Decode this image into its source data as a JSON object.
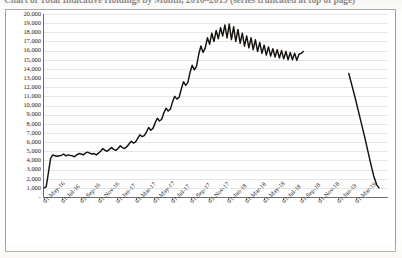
{
  "chart_data": {
    "type": "line",
    "title": "Chart of Total Indicative Holdings by Month, 2016–2019 (series truncated at top of page)",
    "xlabel": "",
    "ylabel": "",
    "grid": true,
    "legend": "none",
    "ylim": [
      0,
      20000
    ],
    "y_ticks": [
      "20,000",
      "19,000",
      "18,000",
      "17,000",
      "16,000",
      "15,000",
      "14,000",
      "13,000",
      "12,000",
      "11,000",
      "10,000",
      "9,000",
      "8,000",
      "7,000",
      "6,000",
      "5,000",
      "4,000",
      "3,000",
      "2,000",
      "1,000",
      "-"
    ],
    "x_ticks": [
      "01-May-16",
      "01-Jul-16",
      "01-Sep-16",
      "01-Nov-16",
      "01-Jan-17",
      "01-Mar-17",
      "01-May-17",
      "01-Jul-17",
      "01-Sep-17",
      "01-Nov-17",
      "01-Jan-18",
      "01-Mar-18",
      "01-May-18",
      "01-Jul-18",
      "01-Sep-18",
      "01-Nov-18",
      "01-Jan-19",
      "01-Mar-19"
    ],
    "x_start": "01-May-16",
    "x_end": "01-Apr-19",
    "series": [
      {
        "name": "main-series",
        "color": "#15120f",
        "note": "continuous trace from May-2016 to approximately Aug-2018",
        "x": [
          "2016-05-01",
          "2016-05-08",
          "2016-05-15",
          "2016-05-22",
          "2016-05-29",
          "2016-06-05",
          "2016-06-12",
          "2016-06-19",
          "2016-06-26",
          "2016-07-03",
          "2016-07-10",
          "2016-07-17",
          "2016-07-24",
          "2016-07-31",
          "2016-08-07",
          "2016-08-14",
          "2016-08-21",
          "2016-08-28",
          "2016-09-04",
          "2016-09-11",
          "2016-09-18",
          "2016-09-25",
          "2016-10-02",
          "2016-10-09",
          "2016-10-16",
          "2016-10-23",
          "2016-10-30",
          "2016-11-06",
          "2016-11-13",
          "2016-11-20",
          "2016-11-27",
          "2016-12-04",
          "2016-12-11",
          "2016-12-18",
          "2016-12-25",
          "2017-01-01",
          "2017-01-08",
          "2017-01-15",
          "2017-01-22",
          "2017-01-29",
          "2017-02-05",
          "2017-02-12",
          "2017-02-19",
          "2017-02-26",
          "2017-03-05",
          "2017-03-12",
          "2017-03-19",
          "2017-03-26",
          "2017-04-02",
          "2017-04-09",
          "2017-04-16",
          "2017-04-23",
          "2017-04-30",
          "2017-05-07",
          "2017-05-14",
          "2017-05-21",
          "2017-05-28",
          "2017-06-04",
          "2017-06-11",
          "2017-06-18",
          "2017-06-25",
          "2017-07-02",
          "2017-07-09",
          "2017-07-16",
          "2017-07-23",
          "2017-07-30",
          "2017-08-06",
          "2017-08-13",
          "2017-08-20",
          "2017-08-27",
          "2017-09-03",
          "2017-09-10",
          "2017-09-17",
          "2017-09-24",
          "2017-10-01",
          "2017-10-08",
          "2017-10-15",
          "2017-10-22",
          "2017-10-29",
          "2017-11-05",
          "2017-11-12",
          "2017-11-19",
          "2017-11-26",
          "2017-12-03",
          "2017-12-10",
          "2017-12-17",
          "2017-12-24",
          "2017-12-31",
          "2018-01-07",
          "2018-01-14",
          "2018-01-21",
          "2018-01-28",
          "2018-02-04",
          "2018-02-11",
          "2018-02-18",
          "2018-02-25",
          "2018-03-04",
          "2018-03-11",
          "2018-03-18",
          "2018-03-25",
          "2018-04-01",
          "2018-04-08",
          "2018-04-15",
          "2018-04-22",
          "2018-04-29",
          "2018-05-06",
          "2018-05-13",
          "2018-05-20",
          "2018-05-27",
          "2018-06-03",
          "2018-06-10",
          "2018-06-17",
          "2018-06-24",
          "2018-07-01",
          "2018-07-08",
          "2018-07-15",
          "2018-07-22",
          "2018-07-29",
          "2018-08-05",
          "2018-08-12"
        ],
        "values": [
          1000,
          1100,
          2600,
          4200,
          4600,
          4500,
          4450,
          4500,
          4550,
          4700,
          4500,
          4600,
          4550,
          4500,
          4400,
          4600,
          4750,
          4700,
          4600,
          4800,
          4900,
          4800,
          4700,
          4750,
          4600,
          4800,
          5000,
          5300,
          5100,
          5000,
          5200,
          5400,
          5200,
          5100,
          5300,
          5600,
          5400,
          5300,
          5500,
          5800,
          6100,
          5900,
          6000,
          6400,
          6800,
          6600,
          6700,
          7100,
          7600,
          7300,
          7500,
          8100,
          8600,
          8300,
          8500,
          9200,
          9700,
          9400,
          9600,
          10400,
          11000,
          10700,
          10900,
          11800,
          12600,
          12200,
          12500,
          13600,
          14400,
          13900,
          14300,
          15600,
          16500,
          15800,
          16300,
          17400,
          16700,
          17900,
          17000,
          18200,
          17300,
          18500,
          17600,
          18800,
          17400,
          18900,
          17200,
          18600,
          17000,
          18300,
          16800,
          17900,
          16500,
          17600,
          16300,
          17400,
          16100,
          17200,
          15900,
          16900,
          15700,
          16600,
          15500,
          16400,
          15400,
          16200,
          15300,
          16100,
          15200,
          16000,
          15100,
          15900,
          15000,
          15800,
          15000,
          15700,
          14950,
          15600,
          15700,
          15900
        ]
      },
      {
        "name": "tail-series",
        "color": "#15120f",
        "note": "separate steep decline segment beginning near Jan-2019",
        "x": [
          "2019-01-05",
          "2019-01-15",
          "2019-01-25",
          "2019-02-04",
          "2019-02-14",
          "2019-02-24",
          "2019-03-06",
          "2019-03-16",
          "2019-03-26",
          "2019-04-05",
          "2019-04-12"
        ],
        "values": [
          13500,
          12200,
          10900,
          9500,
          8100,
          6700,
          5200,
          3700,
          2300,
          1300,
          1000
        ]
      }
    ]
  }
}
